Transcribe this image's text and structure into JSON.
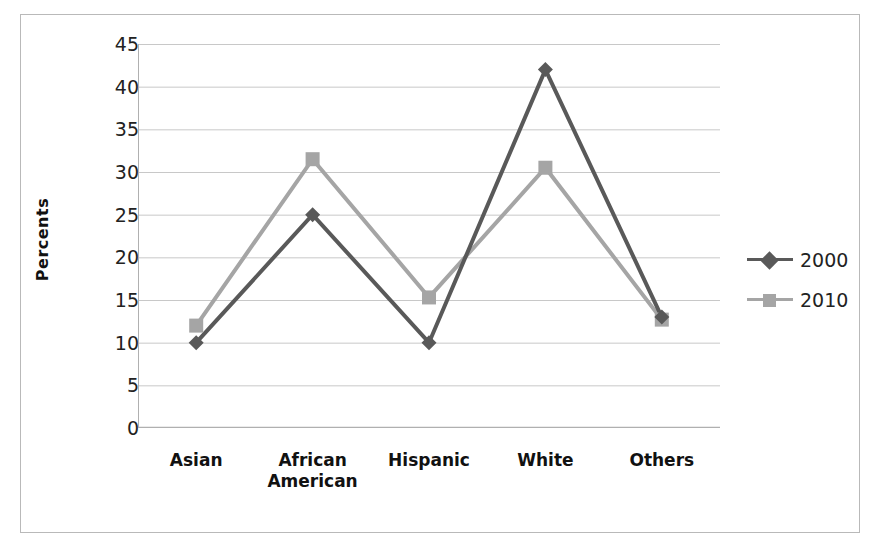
{
  "chart_data": {
    "type": "line",
    "title": "",
    "xlabel": "",
    "ylabel": "Percents",
    "categories": [
      "Asian",
      "African American",
      "Hispanic",
      "White",
      "Others"
    ],
    "series": [
      {
        "name": "2000",
        "values": [
          10,
          25,
          10,
          42,
          13
        ],
        "color": "#595959",
        "marker": "diamond"
      },
      {
        "name": "2010",
        "values": [
          12,
          31.5,
          15.3,
          30.5,
          12.7
        ],
        "color": "#a5a5a5",
        "marker": "square"
      }
    ],
    "ylim": [
      0,
      45
    ],
    "ytick_step": 5,
    "yticks": [
      "0",
      "5",
      "10",
      "15",
      "20",
      "25",
      "30",
      "35",
      "40",
      "45"
    ],
    "grid": "horizontal",
    "legend_position": "right",
    "legend_entries": [
      "2000",
      "2010"
    ]
  },
  "axis": {
    "y_title": "Percents"
  },
  "legend": {
    "items": [
      {
        "label": "2000"
      },
      {
        "label": "2010"
      }
    ]
  },
  "colors": {
    "series_2000": "#595959",
    "series_2010": "#a5a5a5",
    "gridline": "#c8c8c8",
    "axis": "#b0b0b0",
    "frame": "#b9b9b9",
    "text": "#222222"
  }
}
